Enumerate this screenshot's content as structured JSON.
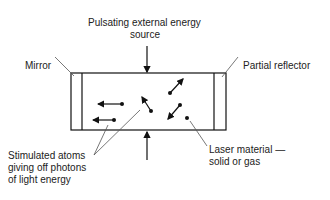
{
  "labels": {
    "source_line1": "Pulsating external energy",
    "source_line2": "source",
    "mirror": "Mirror",
    "partial_reflector": "Partial reflector",
    "stimulated_line1": "Stimulated atoms",
    "stimulated_line2": "giving off photons",
    "stimulated_line3": "of light energy",
    "laser_line1": "Laser material —",
    "laser_line2": "solid or gas"
  }
}
